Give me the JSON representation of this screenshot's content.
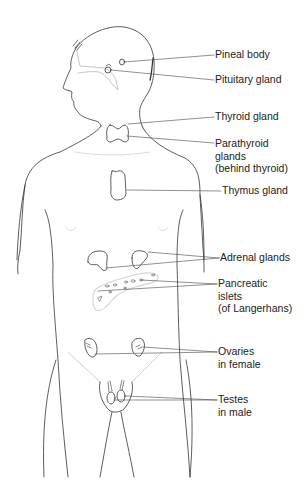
{
  "diagram": {
    "type": "anatomical-line-drawing",
    "line_color": "#333333",
    "shade_color": "#cfcfcf",
    "labels": [
      {
        "id": "pineal",
        "text": "Pineal body",
        "x": 215,
        "y": 48
      },
      {
        "id": "pituitary",
        "text": "Pituitary gland",
        "x": 215,
        "y": 73
      },
      {
        "id": "thyroid",
        "text": "Thyroid gland",
        "x": 215,
        "y": 110
      },
      {
        "id": "parathyroid",
        "text": "Parathyroid\nglands\n(behind thyroid)",
        "x": 215,
        "y": 137
      },
      {
        "id": "thymus",
        "text": "Thymus gland",
        "x": 222,
        "y": 184
      },
      {
        "id": "adrenal",
        "text": "Adrenal glands",
        "x": 220,
        "y": 251
      },
      {
        "id": "pancreatic",
        "text": "Pancreatic\nislets\n(of Langerhans)",
        "x": 218,
        "y": 277
      },
      {
        "id": "ovaries",
        "text": "Ovaries\nin female",
        "x": 218,
        "y": 345
      },
      {
        "id": "testes",
        "text": "Testes\nin male",
        "x": 218,
        "y": 393
      }
    ]
  }
}
